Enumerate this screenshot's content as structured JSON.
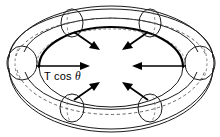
{
  "figure": {
    "kind": "torus-force-diagram",
    "background_color": "#ffffff",
    "line_color": "#1a1a1a",
    "bold_line_color": "#000000",
    "dashed_line_color": "#555555"
  },
  "labels": {
    "tension": {
      "prefix": "T cos ",
      "symbol": "θ",
      "full": "T cos θ"
    }
  },
  "geometry": {
    "outer_ellipse": {
      "cx": 111,
      "cy": 68,
      "rx": 103,
      "ry": 64
    },
    "inner_ellipse": {
      "cx": 111,
      "cy": 67,
      "rx": 72,
      "ry": 40
    },
    "mid_ellipse": {
      "cx": 111,
      "cy": 60,
      "rx": 88,
      "ry": 50
    },
    "top_ellipse": {
      "cx": 111,
      "cy": 52,
      "rx": 95,
      "ry": 50
    }
  },
  "cross_sections": [
    {
      "name": "tube-circle-left",
      "cx": 22,
      "cy": 63,
      "rx": 15,
      "ry": 17
    },
    {
      "name": "tube-circle-right",
      "cx": 200,
      "cy": 63,
      "rx": 15,
      "ry": 17
    },
    {
      "name": "tube-circle-top-left",
      "cx": 72,
      "cy": 22,
      "rx": 11,
      "ry": 14
    },
    {
      "name": "tube-circle-top-right",
      "cx": 150,
      "cy": 22,
      "rx": 11,
      "ry": 14
    },
    {
      "name": "tube-circle-bottom-left",
      "cx": 72,
      "cy": 108,
      "rx": 12,
      "ry": 14
    },
    {
      "name": "tube-circle-bottom-right",
      "cx": 150,
      "cy": 108,
      "rx": 12,
      "ry": 14
    }
  ],
  "arrows": [
    {
      "name": "arrow-left-tension",
      "x1": 40,
      "y1": 67,
      "x2": 84,
      "y2": 67,
      "labeled": true
    },
    {
      "name": "arrow-right",
      "x1": 182,
      "y1": 66,
      "x2": 140,
      "y2": 66,
      "labeled": false
    },
    {
      "name": "arrow-upper-left",
      "x1": 76,
      "y1": 31,
      "x2": 97,
      "y2": 47,
      "labeled": false
    },
    {
      "name": "arrow-upper-right",
      "x1": 146,
      "y1": 31,
      "x2": 126,
      "y2": 47,
      "labeled": false
    },
    {
      "name": "arrow-lower-left",
      "x1": 76,
      "y1": 99,
      "x2": 97,
      "y2": 84,
      "labeled": false
    },
    {
      "name": "arrow-lower-right",
      "x1": 146,
      "y1": 99,
      "x2": 126,
      "y2": 84,
      "labeled": false
    }
  ]
}
